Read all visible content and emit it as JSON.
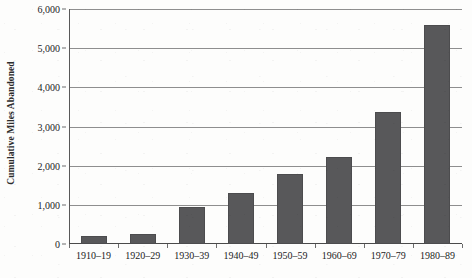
{
  "chart_data": {
    "type": "bar",
    "title": "",
    "xlabel": "",
    "ylabel": "Cumulative Miles Abandoned",
    "categories": [
      "1910–19",
      "1920–29",
      "1930–39",
      "1940–49",
      "1950–59",
      "1960–69",
      "1970–79",
      "1980–89"
    ],
    "values": [
      205,
      260,
      940,
      1290,
      1780,
      2215,
      3370,
      5600
    ],
    "ylim": [
      0,
      6000
    ],
    "yticks": [
      0,
      1000,
      2000,
      3000,
      4000,
      5000,
      6000
    ],
    "ytick_labels": [
      "0",
      "1,000",
      "2,000",
      "3,000",
      "4,000",
      "5,000",
      "6,000"
    ],
    "grid": "horizontal",
    "legend": "none",
    "bar_color": "#58585a",
    "gridline_color": "#8e8e8e",
    "axis_color": "#4a4a4a",
    "background_color": "#fdfdfc"
  }
}
